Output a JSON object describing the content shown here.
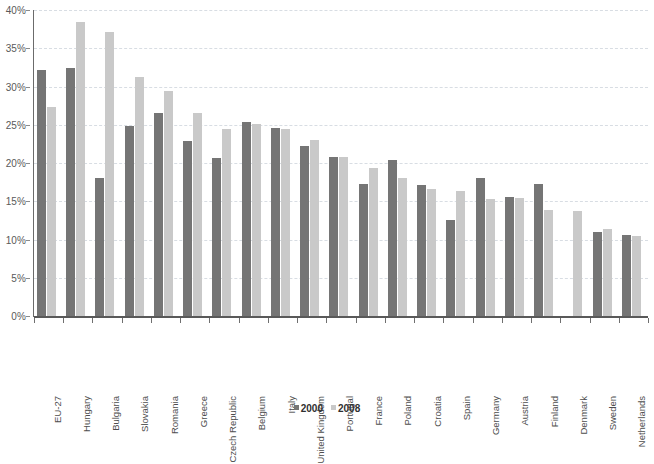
{
  "chart_data": {
    "type": "bar",
    "title": "",
    "xlabel": "",
    "ylabel": "",
    "ylim": [
      0,
      40
    ],
    "ytick_labels": [
      "0%",
      "5%",
      "10%",
      "15%",
      "20%",
      "25%",
      "30%",
      "35%",
      "40%"
    ],
    "ytick_values": [
      0,
      5,
      10,
      15,
      20,
      25,
      30,
      35,
      40
    ],
    "grid": true,
    "legend_position": "bottom",
    "categories": [
      "EU-27",
      "Hungary",
      "Bulgaria",
      "Slovakia",
      "Romania",
      "Greece",
      "Czech Republic",
      "Belgium",
      "Italy",
      "United Kingdom",
      "Portugal",
      "France",
      "Poland",
      "Croatia",
      "Spain",
      "Germany",
      "Austria",
      "Finland",
      "Denmark",
      "Sweden",
      "Netherlands"
    ],
    "series": [
      {
        "name": "2000",
        "color": "#757575",
        "values": [
          32.2,
          32.4,
          18.0,
          24.8,
          26.5,
          22.9,
          20.7,
          25.3,
          24.6,
          22.2,
          20.8,
          17.3,
          20.4,
          17.1,
          12.5,
          18.0,
          15.5,
          17.2,
          null,
          11.0,
          10.6
        ]
      },
      {
        "name": "2008",
        "color": "#c9c9c9",
        "values": [
          27.3,
          38.4,
          37.1,
          31.3,
          29.4,
          26.5,
          24.4,
          25.1,
          24.5,
          23.0,
          20.8,
          19.3,
          18.0,
          16.6,
          16.4,
          15.3,
          15.4,
          13.9,
          13.7,
          11.4,
          10.5
        ]
      }
    ]
  },
  "legend": {
    "items": [
      {
        "label": "2000",
        "swatch": "s2000"
      },
      {
        "label": "2008",
        "swatch": "s2008"
      }
    ]
  },
  "colors": {
    "series_2000": "#757575",
    "series_2008": "#c9c9c9",
    "gridline": "#d8dde3",
    "axis": "#595959",
    "text": "#4d4d4d",
    "background": "#ffffff"
  }
}
